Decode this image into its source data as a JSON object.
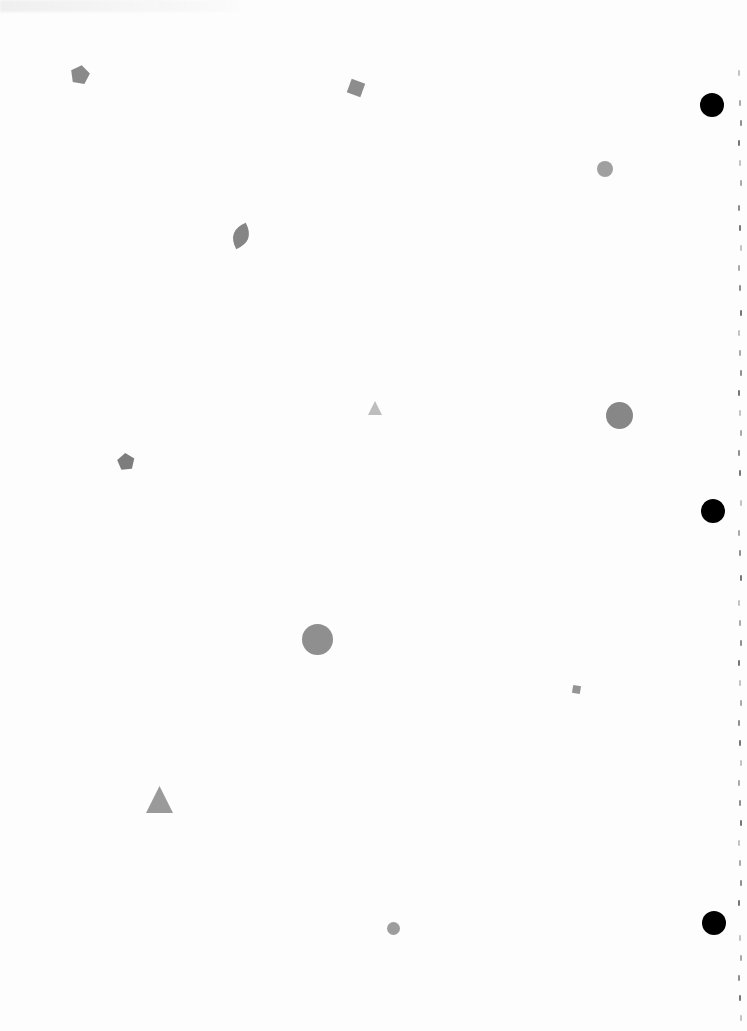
{
  "page": {
    "width": 747,
    "height": 1031,
    "background": "#ffffff"
  },
  "shapes": [
    {
      "type": "pentagon",
      "cx": 80,
      "cy": 75,
      "size": 20,
      "rotation": 10,
      "color": "#8a8a8a"
    },
    {
      "type": "square",
      "cx": 356,
      "cy": 88,
      "size": 20,
      "rotation": 20,
      "color": "#8d8d8d"
    },
    {
      "type": "leaf",
      "cx": 241,
      "cy": 236,
      "size": 28,
      "rotation": 20,
      "color": "#858585"
    },
    {
      "type": "circle",
      "cx": 605,
      "cy": 169,
      "size": 16,
      "rotation": 0,
      "color": "#a0a0a0"
    },
    {
      "type": "triangle",
      "cx": 375,
      "cy": 408,
      "size": 14,
      "rotation": 0,
      "color": "#bdbdbd"
    },
    {
      "type": "circle",
      "cx": 619,
      "cy": 415,
      "size": 27,
      "rotation": 0,
      "color": "#878787"
    },
    {
      "type": "pentagon",
      "cx": 126,
      "cy": 462,
      "size": 18,
      "rotation": -5,
      "color": "#7d7d7d"
    },
    {
      "type": "circle",
      "cx": 317,
      "cy": 639,
      "size": 31,
      "rotation": 0,
      "color": "#8f8f8f"
    },
    {
      "type": "square",
      "cx": 576,
      "cy": 689,
      "size": 11,
      "rotation": 10,
      "color": "#949494"
    },
    {
      "type": "triangle",
      "cx": 159,
      "cy": 799,
      "size": 27,
      "rotation": 0,
      "color": "#9a9a9a"
    },
    {
      "type": "circle",
      "cx": 393,
      "cy": 928,
      "size": 13,
      "rotation": 0,
      "color": "#9d9d9d"
    }
  ],
  "punch_holes": [
    {
      "cx": 712,
      "cy": 105,
      "size": 24
    },
    {
      "cx": 713,
      "cy": 511,
      "size": 24
    },
    {
      "cx": 714,
      "cy": 923,
      "size": 24
    }
  ],
  "margin_marks_y": [
    70,
    100,
    120,
    140,
    160,
    180,
    205,
    225,
    245,
    265,
    285,
    310,
    330,
    350,
    370,
    390,
    410,
    430,
    450,
    470,
    500,
    530,
    550,
    575,
    600,
    620,
    640,
    660,
    680,
    700,
    720,
    740,
    760,
    780,
    800,
    820,
    840,
    860,
    880,
    900,
    935,
    955,
    975,
    995,
    1015
  ]
}
